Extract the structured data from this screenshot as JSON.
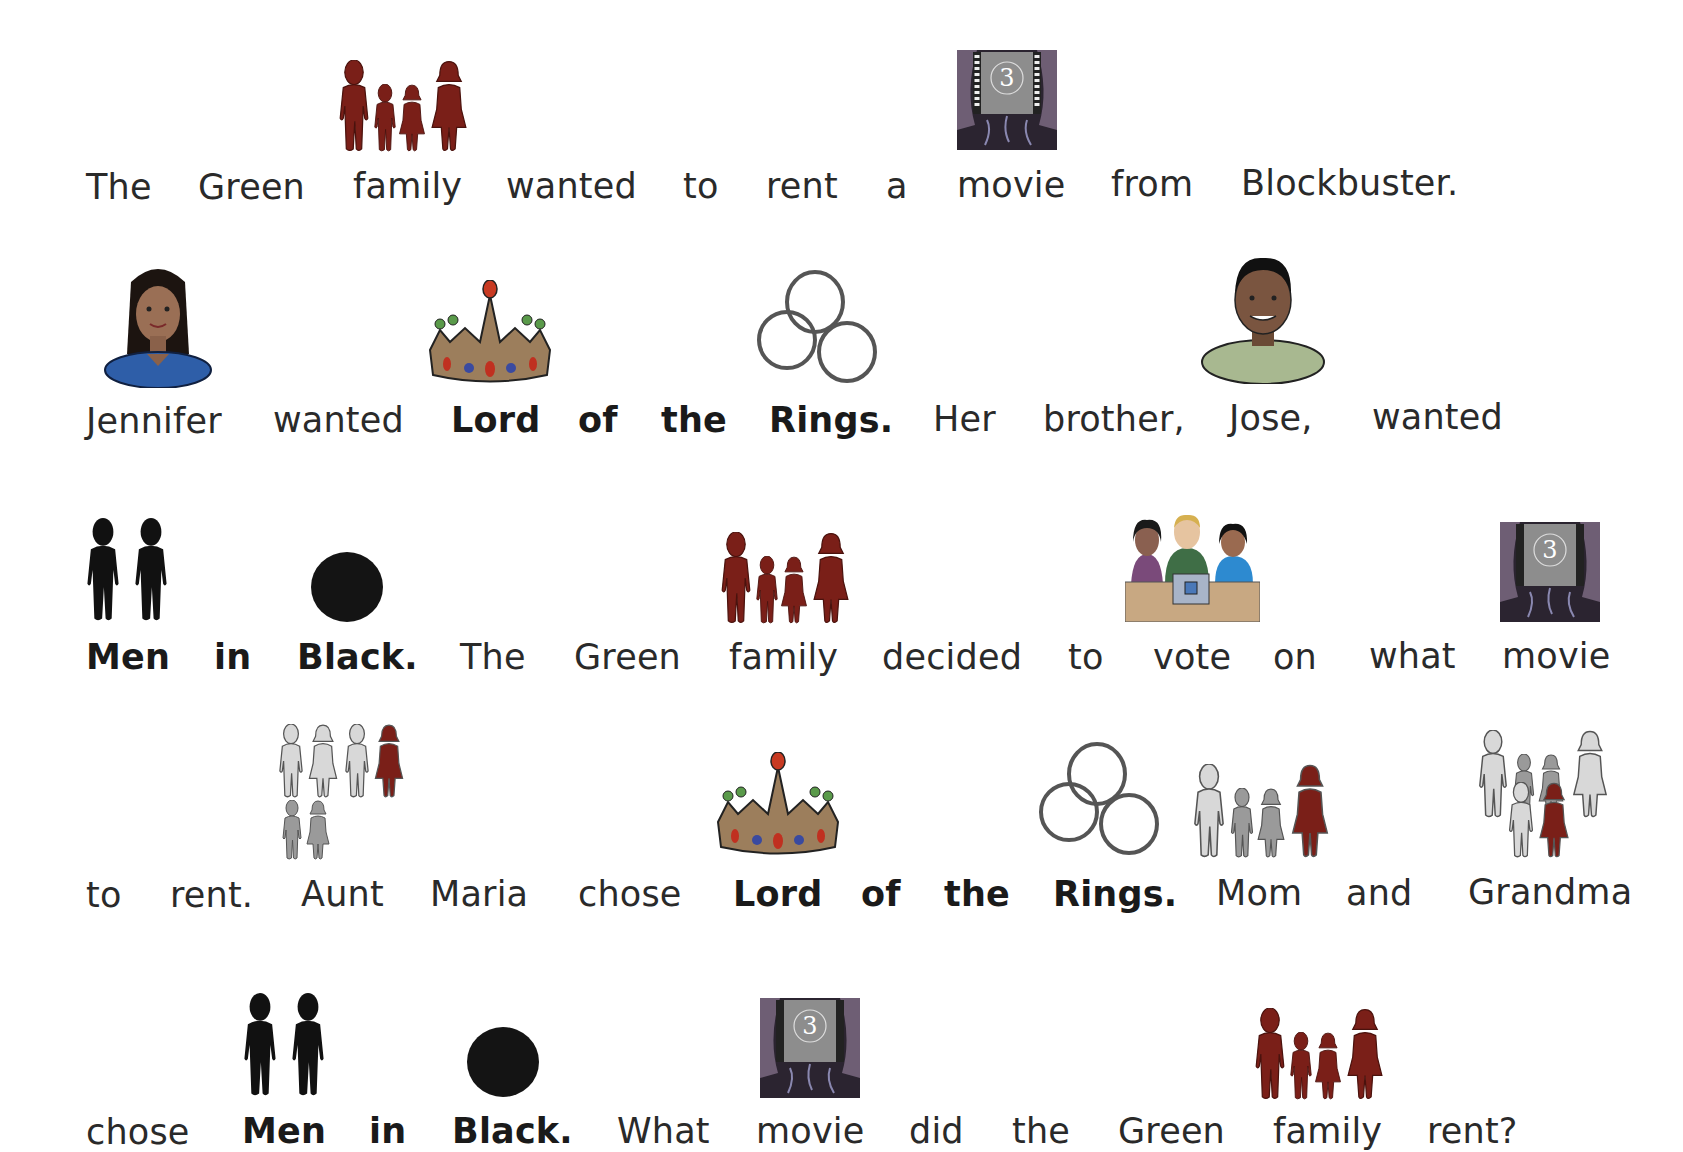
{
  "story": {
    "lines": [
      {
        "words": [
          "The",
          "Green",
          "family",
          "wanted",
          "to",
          "rent",
          "a",
          "movie",
          "from",
          "Blockbuster."
        ]
      },
      {
        "words": [
          "Jennifer",
          "wanted",
          "Lord",
          "of",
          "the",
          "Rings.",
          "Her",
          "brother,",
          "Jose,",
          "wanted"
        ]
      },
      {
        "words": [
          "Men",
          "in",
          "Black.",
          "The",
          "Green",
          "family",
          "decided",
          "to",
          "vote",
          "on",
          "what",
          "movie"
        ]
      },
      {
        "words": [
          "to",
          "rent.",
          "Aunt",
          "Maria",
          "chose",
          "Lord",
          "of",
          "the",
          "Rings.",
          "Mom",
          "and",
          "Grandma"
        ]
      },
      {
        "words": [
          "chose",
          "Men",
          "in",
          "Black.",
          "What",
          "movie",
          "did",
          "the",
          "Green",
          "family",
          "rent?"
        ]
      }
    ]
  },
  "symbols": {
    "family": "family-icon",
    "movie": "movie-theater-icon",
    "jennifer": "woman-portrait-icon",
    "jose": "man-portrait-icon",
    "lord": "crown-icon",
    "rings": "three-rings-icon",
    "men": "two-men-icon",
    "black": "black-circle-icon",
    "vote": "voting-people-icon",
    "aunt": "aunt-relation-icon",
    "mom": "mom-relation-icon",
    "grandma": "grandma-relation-icon"
  },
  "colors": {
    "family": "#7a1f18",
    "black": "#111111",
    "grey_light": "#d8d8d8",
    "grey_mid": "#9a9a9a",
    "text": "#2a2a2a"
  }
}
